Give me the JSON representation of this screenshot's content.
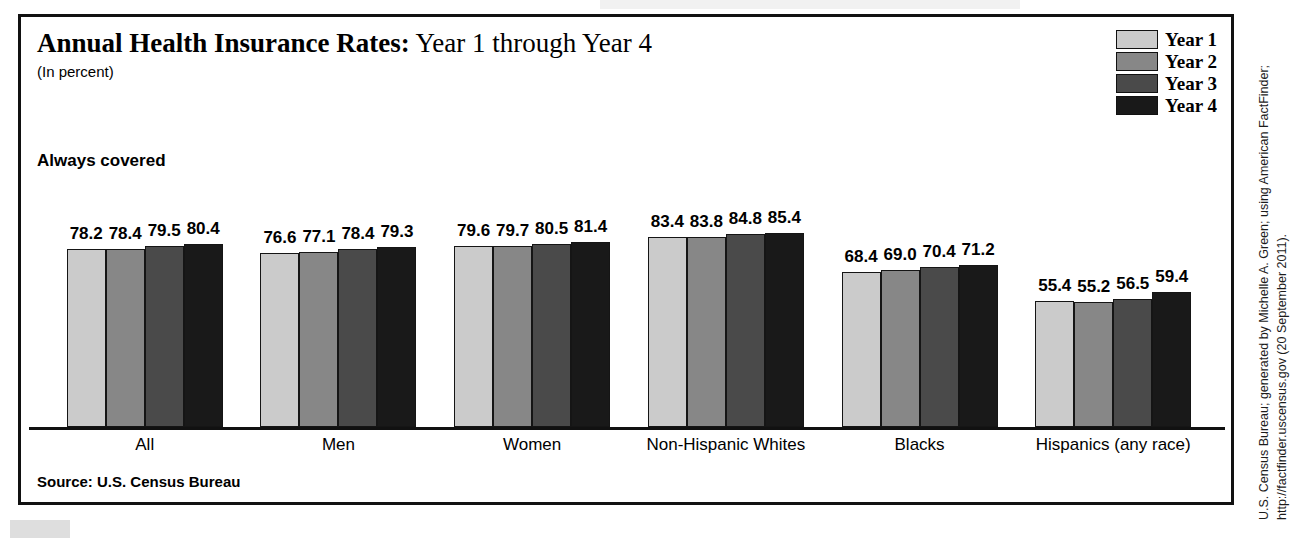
{
  "figure": {
    "title_strong": "Annual Health Insurance Rates:",
    "title_light": "Year 1 through Year 4",
    "subtitle": "(In percent)",
    "section_heading": "Always covered",
    "source": "Source: U.S. Census Bureau",
    "credit_line_1": "U.S. Census Bureau; generated by Michelle A. Green; using American FactFinder;",
    "credit_line_2": "http://factfinder.uscensus.gov (20 September 2011)."
  },
  "legend": {
    "items": [
      {
        "label": "Year 1",
        "color": "#cbcbcb"
      },
      {
        "label": "Year 2",
        "color": "#878787"
      },
      {
        "label": "Year 3",
        "color": "#4a4a4a"
      },
      {
        "label": "Year 4",
        "color": "#191919"
      }
    ]
  },
  "chart_data": {
    "type": "bar",
    "title": "Annual Health Insurance Rates: Year 1 through Year 4",
    "subtitle": "(In percent)",
    "section": "Always covered",
    "xlabel": "",
    "ylabel": "Percent",
    "ylim": [
      0,
      100
    ],
    "grid": false,
    "legend_position": "top-right",
    "categories": [
      "All",
      "Men",
      "Women",
      "Non-Hispanic Whites",
      "Blacks",
      "Hispanics (any race)"
    ],
    "series": [
      {
        "name": "Year 1",
        "color": "#cbcbcb",
        "values": [
          78.2,
          76.6,
          79.6,
          83.4,
          68.4,
          55.4
        ]
      },
      {
        "name": "Year 2",
        "color": "#878787",
        "values": [
          78.4,
          77.1,
          79.7,
          83.8,
          69.0,
          55.2
        ]
      },
      {
        "name": "Year 3",
        "color": "#4a4a4a",
        "values": [
          79.5,
          78.4,
          80.5,
          84.8,
          70.4,
          56.5
        ]
      },
      {
        "name": "Year 4",
        "color": "#191919",
        "values": [
          80.4,
          79.3,
          81.4,
          85.4,
          71.2,
          59.4
        ]
      }
    ],
    "value_labels": [
      [
        "78.2",
        "78.4",
        "79.5",
        "80.4"
      ],
      [
        "76.6",
        "77.1",
        "78.4",
        "79.3"
      ],
      [
        "79.6",
        "79.7",
        "80.5",
        "81.4"
      ],
      [
        "83.4",
        "83.8",
        "84.8",
        "85.4"
      ],
      [
        "68.4",
        "69.0",
        "70.4",
        "71.2"
      ],
      [
        "55.4",
        "55.2",
        "56.5",
        "59.4"
      ]
    ],
    "source": "Source: U.S. Census Bureau"
  }
}
